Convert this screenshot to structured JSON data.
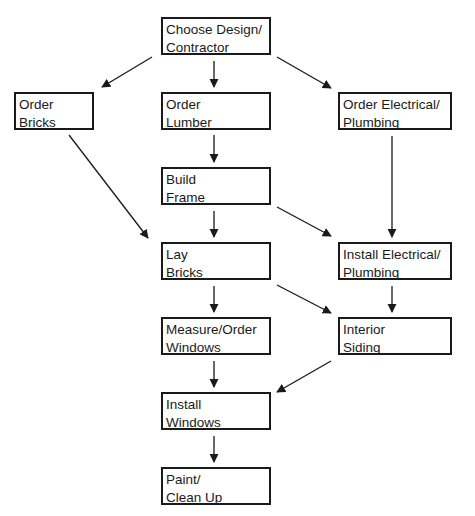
{
  "diagram": {
    "type": "flowchart",
    "colors": {
      "stroke": "#1a1a1a",
      "background": "#ffffff"
    },
    "nodes": [
      {
        "id": "choose",
        "lines": [
          "Choose Design/",
          "Contractor"
        ],
        "box": [
          161,
          17,
          110,
          38
        ]
      },
      {
        "id": "bricks",
        "lines": [
          "Order",
          "Bricks"
        ],
        "box": [
          14,
          92,
          80,
          38
        ]
      },
      {
        "id": "lumber",
        "lines": [
          "Order",
          "Lumber"
        ],
        "box": [
          161,
          92,
          110,
          38
        ]
      },
      {
        "id": "elec_order",
        "lines": [
          "Order Electrical/",
          "Plumbing"
        ],
        "box": [
          338,
          92,
          114,
          38
        ]
      },
      {
        "id": "frame",
        "lines": [
          "Build",
          "Frame"
        ],
        "box": [
          161,
          167,
          110,
          38
        ]
      },
      {
        "id": "lay",
        "lines": [
          "Lay",
          "Bricks"
        ],
        "box": [
          161,
          242,
          110,
          38
        ]
      },
      {
        "id": "elec_install",
        "lines": [
          "Install Electrical/",
          "Plumbing"
        ],
        "box": [
          338,
          242,
          114,
          38
        ]
      },
      {
        "id": "measure",
        "lines": [
          "Measure/Order",
          "Windows"
        ],
        "box": [
          161,
          317,
          110,
          38
        ]
      },
      {
        "id": "siding",
        "lines": [
          "Interior",
          "Siding"
        ],
        "box": [
          338,
          317,
          114,
          38
        ]
      },
      {
        "id": "install_win",
        "lines": [
          "Install",
          "Windows"
        ],
        "box": [
          161,
          392,
          110,
          38
        ]
      },
      {
        "id": "paint",
        "lines": [
          "Paint/",
          "Clean Up"
        ],
        "box": [
          161,
          467,
          110,
          38
        ]
      }
    ],
    "edges": [
      {
        "from": "choose",
        "to": "bricks",
        "path": [
          152,
          57,
          102,
          87
        ]
      },
      {
        "from": "choose",
        "to": "lumber",
        "path": [
          214,
          61,
          214,
          87
        ]
      },
      {
        "from": "choose",
        "to": "elec_order",
        "path": [
          277,
          57,
          331,
          88
        ]
      },
      {
        "from": "bricks",
        "to": "lay",
        "path": [
          69,
          135,
          148,
          238
        ]
      },
      {
        "from": "lumber",
        "to": "frame",
        "path": [
          214,
          135,
          214,
          162
        ]
      },
      {
        "from": "elec_order",
        "to": "elec_install",
        "path": [
          392,
          136,
          392,
          237
        ]
      },
      {
        "from": "frame",
        "to": "lay",
        "path": [
          214,
          211,
          214,
          237
        ]
      },
      {
        "from": "frame",
        "to": "elec_install",
        "path": [
          277,
          207,
          331,
          236
        ]
      },
      {
        "from": "lay",
        "to": "measure",
        "path": [
          214,
          286,
          214,
          312
        ]
      },
      {
        "from": "lay",
        "to": "siding",
        "path": [
          277,
          285,
          331,
          313
        ]
      },
      {
        "from": "elec_install",
        "to": "siding",
        "path": [
          392,
          286,
          392,
          312
        ]
      },
      {
        "from": "measure",
        "to": "install_win",
        "path": [
          214,
          361,
          214,
          387
        ]
      },
      {
        "from": "siding",
        "to": "install_win",
        "path": [
          331,
          361,
          277,
          392
        ]
      },
      {
        "from": "install_win",
        "to": "paint",
        "path": [
          214,
          436,
          214,
          462
        ]
      }
    ]
  }
}
